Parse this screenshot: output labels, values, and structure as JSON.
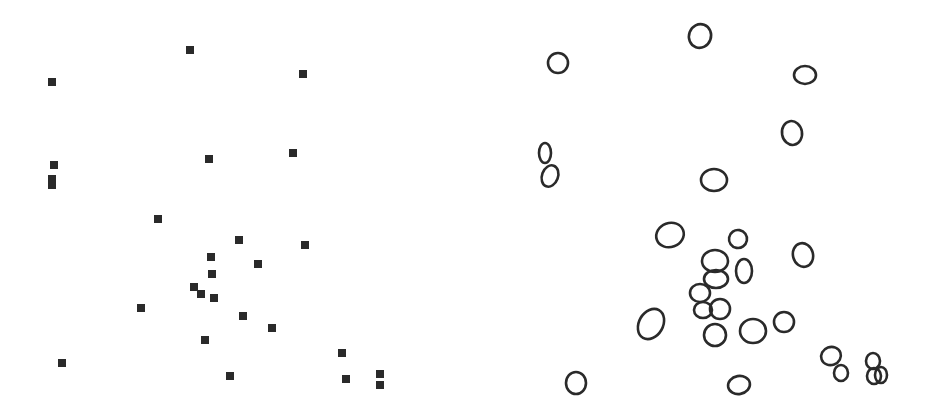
{
  "figure": {
    "width": 932,
    "height": 415,
    "background": "#ffffff",
    "ink_color": "#2a2a2a",
    "panels": [
      {
        "id": "left",
        "kind": "point-markers",
        "marker_shape": "square",
        "marker_size": 8,
        "points": [
          [
            190,
            50
          ],
          [
            52,
            82
          ],
          [
            303,
            74
          ],
          [
            54,
            165
          ],
          [
            52,
            179
          ],
          [
            52,
            185
          ],
          [
            209,
            159
          ],
          [
            293,
            153
          ],
          [
            158,
            219
          ],
          [
            239,
            240
          ],
          [
            305,
            245
          ],
          [
            211,
            257
          ],
          [
            258,
            264
          ],
          [
            212,
            274
          ],
          [
            194,
            287
          ],
          [
            201,
            294
          ],
          [
            214,
            298
          ],
          [
            141,
            308
          ],
          [
            243,
            316
          ],
          [
            272,
            328
          ],
          [
            205,
            340
          ],
          [
            342,
            353
          ],
          [
            62,
            363
          ],
          [
            230,
            376
          ],
          [
            346,
            379
          ],
          [
            380,
            374
          ],
          [
            380,
            385
          ]
        ]
      },
      {
        "id": "right",
        "kind": "cell-outlines",
        "stroke_width": 2.6,
        "cells": [
          {
            "cx": 700,
            "cy": 36,
            "rx": 11,
            "ry": 12,
            "rot": 20
          },
          {
            "cx": 558,
            "cy": 63,
            "rx": 10,
            "ry": 10,
            "rot": 0
          },
          {
            "cx": 805,
            "cy": 75,
            "rx": 11,
            "ry": 9,
            "rot": 0
          },
          {
            "cx": 792,
            "cy": 133,
            "rx": 10,
            "ry": 12,
            "rot": -10
          },
          {
            "cx": 545,
            "cy": 153,
            "rx": 6,
            "ry": 10,
            "rot": 0
          },
          {
            "cx": 550,
            "cy": 176,
            "rx": 8,
            "ry": 11,
            "rot": 20
          },
          {
            "cx": 714,
            "cy": 180,
            "rx": 13,
            "ry": 11,
            "rot": 0
          },
          {
            "cx": 670,
            "cy": 235,
            "rx": 14,
            "ry": 12,
            "rot": -20
          },
          {
            "cx": 738,
            "cy": 239,
            "rx": 9,
            "ry": 9,
            "rot": 10
          },
          {
            "cx": 715,
            "cy": 261,
            "rx": 13,
            "ry": 11,
            "rot": 0
          },
          {
            "cx": 803,
            "cy": 255,
            "rx": 10,
            "ry": 12,
            "rot": -15
          },
          {
            "cx": 744,
            "cy": 271,
            "rx": 8,
            "ry": 12,
            "rot": 0
          },
          {
            "cx": 716,
            "cy": 279,
            "rx": 12,
            "ry": 9,
            "rot": 0
          },
          {
            "cx": 700,
            "cy": 293,
            "rx": 10,
            "ry": 9,
            "rot": 0
          },
          {
            "cx": 703,
            "cy": 310,
            "rx": 9,
            "ry": 8,
            "rot": 0
          },
          {
            "cx": 720,
            "cy": 309,
            "rx": 10,
            "ry": 10,
            "rot": 0
          },
          {
            "cx": 651,
            "cy": 324,
            "rx": 12,
            "ry": 16,
            "rot": 30
          },
          {
            "cx": 715,
            "cy": 335,
            "rx": 11,
            "ry": 11,
            "rot": 0
          },
          {
            "cx": 753,
            "cy": 331,
            "rx": 13,
            "ry": 12,
            "rot": 0
          },
          {
            "cx": 784,
            "cy": 322,
            "rx": 10,
            "ry": 10,
            "rot": 0
          },
          {
            "cx": 831,
            "cy": 356,
            "rx": 10,
            "ry": 9,
            "rot": -20
          },
          {
            "cx": 841,
            "cy": 373,
            "rx": 7,
            "ry": 8,
            "rot": 0
          },
          {
            "cx": 873,
            "cy": 361,
            "rx": 7,
            "ry": 8,
            "rot": 0
          },
          {
            "cx": 874,
            "cy": 376,
            "rx": 7,
            "ry": 8,
            "rot": 0
          },
          {
            "cx": 881,
            "cy": 375,
            "rx": 6,
            "ry": 8,
            "rot": 0
          },
          {
            "cx": 576,
            "cy": 383,
            "rx": 10,
            "ry": 11,
            "rot": 0
          },
          {
            "cx": 739,
            "cy": 385,
            "rx": 11,
            "ry": 9,
            "rot": -10
          }
        ]
      }
    ]
  }
}
